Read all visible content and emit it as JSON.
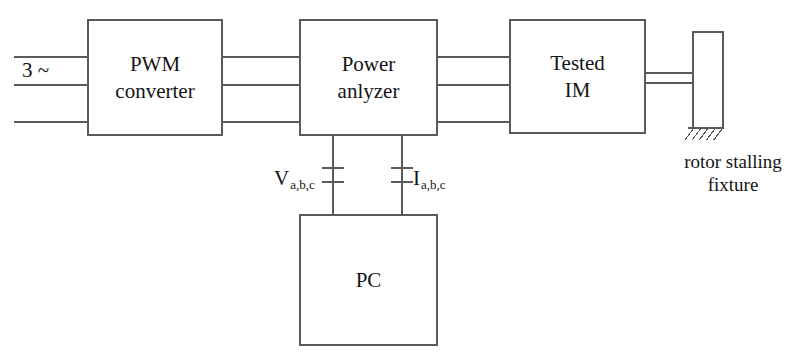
{
  "figure": {
    "type": "block-diagram",
    "background_color": "#ffffff",
    "line_color": "#5a5a5a",
    "text_color": "#141414"
  },
  "blocks": [
    {
      "id": "pwm-converter",
      "lines": [
        "PWM",
        "converter"
      ],
      "x": 88,
      "y": 20,
      "w": 134,
      "h": 115
    },
    {
      "id": "power-analyzer",
      "lines": [
        "Power",
        "anlyzer"
      ],
      "x": 300,
      "y": 20,
      "w": 137,
      "h": 115
    },
    {
      "id": "tested-im",
      "lines": [
        "Tested",
        "IM"
      ],
      "x": 510,
      "y": 20,
      "w": 135,
      "h": 113
    },
    {
      "id": "pc",
      "lines": [
        "PC"
      ],
      "x": 300,
      "y": 215,
      "w": 137,
      "h": 130
    },
    {
      "id": "stalling-fixture",
      "lines": [],
      "x": 693,
      "y": 32,
      "w": 30,
      "h": 96
    }
  ],
  "source_label": {
    "text": "3 ~",
    "x": 22,
    "y": 58
  },
  "signal_labels": [
    {
      "id": "voltage",
      "symbol": "V",
      "subscript": "a,b,c",
      "x": 274,
      "y": 166
    },
    {
      "id": "current",
      "symbol": "I",
      "subscript": "a,b,c",
      "x": 413,
      "y": 166
    }
  ],
  "caption": {
    "id": "rotor-stalling-fixture",
    "lines": [
      "rotor stalling",
      "fixture"
    ],
    "x": 663,
    "y": 150,
    "w": 140
  },
  "top_fragment": {
    "text": "..."
  },
  "phase_lines": {
    "count": 3,
    "y_positions": [
      57,
      85,
      122
    ],
    "input_x_start": 14,
    "segments": [
      {
        "from": "mains",
        "to": "pwm-converter",
        "x1": 14,
        "x2": 88
      },
      {
        "from": "pwm-converter",
        "to": "power-analyzer",
        "x1": 222,
        "x2": 300
      },
      {
        "from": "power-analyzer",
        "to": "tested-im",
        "x1": 437,
        "x2": 510
      }
    ]
  },
  "shaft": {
    "from": "tested-im",
    "to": "stalling-fixture",
    "x1": 645,
    "x2": 693,
    "y_top": 73,
    "y_bottom": 83
  },
  "ground_hatch": {
    "x": 688,
    "y": 128,
    "width": 36,
    "strokes": 5
  },
  "measurement_drops": [
    {
      "id": "voltage-drop",
      "x": 333,
      "y1": 135,
      "y2": 215,
      "marker_y": [
        168,
        182
      ]
    },
    {
      "id": "current-drop",
      "x": 402,
      "y1": 135,
      "y2": 215,
      "marker_y": [
        168,
        182
      ]
    }
  ]
}
